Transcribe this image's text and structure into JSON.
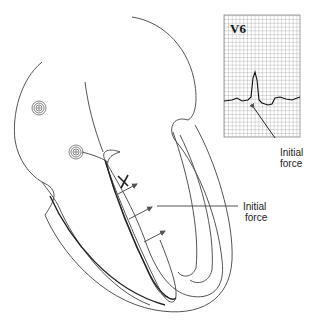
{
  "ecg": {
    "lead_label": "V6",
    "annotation": [
      "Initial",
      "force"
    ]
  },
  "heart": {
    "annotation": [
      "Initial",
      "force"
    ],
    "marker": "X"
  },
  "colors": {
    "line": "#555555",
    "grid": "#8a8a8a",
    "text": "#222222"
  }
}
